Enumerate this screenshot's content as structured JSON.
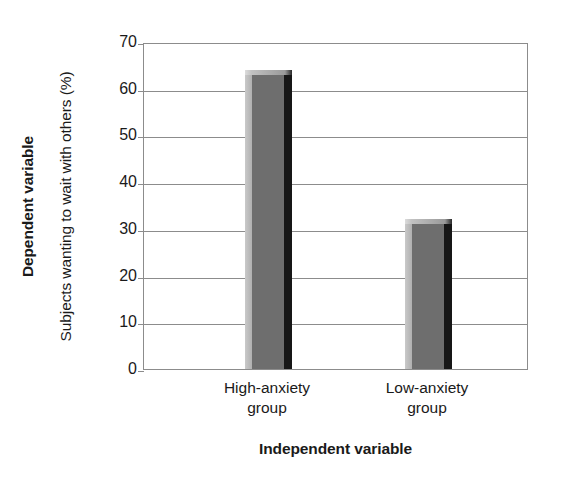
{
  "chart_data": {
    "type": "bar",
    "title": "",
    "subtitle": "",
    "categories": [
      "High-anxiety group",
      "Low-anxiety group"
    ],
    "category_lines": [
      [
        "High-anxiety",
        "group"
      ],
      [
        "Low-anxiety",
        "group"
      ]
    ],
    "values": [
      63,
      31
    ],
    "xlabel": "Independent variable",
    "ylabel": "Subjects wanting to wait with others (%)",
    "ylabel_outer": "Dependent variable",
    "ylim": [
      0,
      70
    ],
    "ytick_step": 10,
    "yticks": [
      70,
      60,
      50,
      40,
      30,
      20,
      10,
      0
    ],
    "ytick_labels": [
      "70",
      "60",
      "50",
      "40",
      "30",
      "20",
      "10",
      "0"
    ],
    "grid": true,
    "grid_axis": "y",
    "legend": false,
    "legend_position": "none",
    "bar_face_color": "#6e6e6e",
    "bar_left_color": "#b8b8b8",
    "bar_right_color": "#171717",
    "axis_color": "#8c8c8c",
    "background_color": "#ffffff",
    "text_color": "#1a1a1a"
  }
}
